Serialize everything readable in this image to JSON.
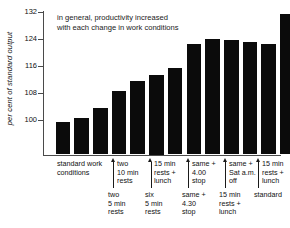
{
  "chart_data": {
    "type": "bar",
    "title": "",
    "annotation": [
      "in general, productivity increased",
      "with each change in work conditions"
    ],
    "xlabel": "",
    "ylabel": "per cent of standard output",
    "ylim": [
      94.5,
      132
    ],
    "yticks": [
      100,
      108,
      116,
      124,
      132
    ],
    "ytick_labels": [
      "100",
      "108",
      "116",
      "124",
      "132"
    ],
    "grid": false,
    "legend": "none",
    "bar_color": "#0b0b0b",
    "categories": [
      "standard work conditions 1",
      "standard work conditions 2",
      "standard work conditions 3",
      "two 5 min rests",
      "two 10 min rests",
      "six 5 min rests",
      "15 min rests + lunch",
      "same + 4.30 stop",
      "same + 4.00 stop",
      "15 min rests + lunch",
      "same + Sat a.m. off",
      "standard",
      "15 min rests + lunch"
    ],
    "values": [
      99.5,
      100.5,
      103.5,
      108.7,
      111.5,
      113.2,
      115.5,
      122.3,
      123.9,
      123.5,
      123.0,
      122.3,
      131.3
    ]
  },
  "annotation": {
    "line1": "in general, productivity increased",
    "line2": "with each change in work conditions"
  },
  "axis": {
    "y_title": "per cent of standard output",
    "ticks": [
      {
        "label": "132"
      },
      {
        "label": "124"
      },
      {
        "label": "116"
      },
      {
        "label": "108"
      },
      {
        "label": "100"
      }
    ]
  },
  "labels": {
    "standard_work": {
      "l1": "standard work",
      "l2": "conditions"
    },
    "upper": [
      {
        "l1": "two",
        "l2": "10 min",
        "l3": "rests"
      },
      {
        "l1": "15 min",
        "l2": "rests +",
        "l3": "lunch"
      },
      {
        "l1": "same +",
        "l2": "4.00",
        "l3": "stop"
      },
      {
        "l1": "same +",
        "l2": "Sat a.m.",
        "l3": "off"
      },
      {
        "l1": "15 min",
        "l2": "rests +",
        "l3": "lunch"
      }
    ],
    "lower": [
      {
        "l1": "two",
        "l2": "5 min",
        "l3": "rests"
      },
      {
        "l1": "six",
        "l2": "5 min",
        "l3": "rests"
      },
      {
        "l1": "same +",
        "l2": "4.30",
        "l3": "stop"
      },
      {
        "l1": "15 min",
        "l2": "rests +",
        "l3": "lunch"
      },
      {
        "l1": "standard",
        "l2": "",
        "l3": ""
      }
    ]
  }
}
